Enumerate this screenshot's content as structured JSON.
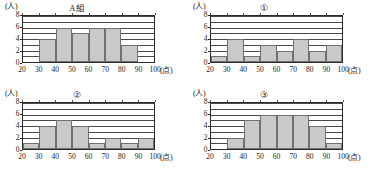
{
  "axis": {
    "y_unit": "(人)",
    "x_unit": "(点)",
    "y_ticks": [
      "0",
      "2",
      "4",
      "6",
      "8"
    ],
    "y_tick_values": [
      0,
      2,
      4,
      6,
      8
    ],
    "y_max": 8,
    "x_ticks": [
      "20",
      "30",
      "40",
      "50",
      "60",
      "70",
      "80",
      "90",
      "100"
    ],
    "x_tick_values": [
      20,
      30,
      40,
      50,
      60,
      70,
      80,
      90,
      100
    ],
    "x_min": 20,
    "x_max": 100,
    "bin_width": 10,
    "gridlines_count": 8,
    "bar_color": "#c9c9c9",
    "bar_border_color": "#707070",
    "axis_color": "#2a2a2a"
  },
  "chart_data": [
    {
      "type": "bar",
      "title": "A組",
      "xlabel": "(点)",
      "ylabel": "(人)",
      "ylim": [
        0,
        8
      ],
      "xlim": [
        20,
        100
      ],
      "grid": true,
      "legend": "none",
      "bin_edges": [
        20,
        30,
        40,
        50,
        60,
        70,
        80,
        90,
        100
      ],
      "categories": [
        "20-30",
        "30-40",
        "40-50",
        "50-60",
        "60-70",
        "70-80",
        "80-90",
        "90-100"
      ],
      "values": [
        0,
        4,
        6,
        5,
        6,
        6,
        3,
        0
      ]
    },
    {
      "type": "bar",
      "title": "①",
      "xlabel": "(点)",
      "ylabel": "(人)",
      "ylim": [
        0,
        8
      ],
      "xlim": [
        20,
        100
      ],
      "grid": true,
      "legend": "none",
      "bin_edges": [
        20,
        30,
        40,
        50,
        60,
        70,
        80,
        90,
        100
      ],
      "categories": [
        "20-30",
        "30-40",
        "40-50",
        "50-60",
        "60-70",
        "70-80",
        "80-90",
        "90-100"
      ],
      "values": [
        1,
        4,
        1,
        3,
        2,
        4,
        2,
        3
      ]
    },
    {
      "type": "bar",
      "title": "②",
      "xlabel": "(点)",
      "ylabel": "(人)",
      "ylim": [
        0,
        8
      ],
      "xlim": [
        20,
        100
      ],
      "grid": true,
      "legend": "none",
      "bin_edges": [
        20,
        30,
        40,
        50,
        60,
        70,
        80,
        90,
        100
      ],
      "categories": [
        "20-30",
        "30-40",
        "40-50",
        "50-60",
        "60-70",
        "70-80",
        "80-90",
        "90-100"
      ],
      "values": [
        1,
        4,
        5,
        4,
        1,
        2,
        1,
        2
      ]
    },
    {
      "type": "bar",
      "title": "③",
      "xlabel": "(点)",
      "ylabel": "(人)",
      "ylim": [
        0,
        8
      ],
      "xlim": [
        20,
        100
      ],
      "grid": true,
      "legend": "none",
      "bin_edges": [
        20,
        30,
        40,
        50,
        60,
        70,
        80,
        90,
        100
      ],
      "categories": [
        "20-30",
        "30-40",
        "40-50",
        "50-60",
        "60-70",
        "70-80",
        "80-90",
        "90-100"
      ],
      "values": [
        0,
        2,
        5,
        6,
        6,
        6,
        4,
        1
      ]
    }
  ]
}
